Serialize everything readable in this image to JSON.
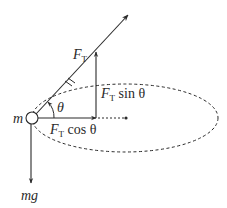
{
  "diagram": {
    "type": "force-diagram",
    "colors": {
      "stroke": "#2a2a2a",
      "background": "#ffffff"
    },
    "labels": {
      "mass": "m",
      "tension": "F",
      "tension_sub": "T",
      "vertical_component_prefix": "F",
      "vertical_component_sub": "T",
      "vertical_component_suffix": " sin θ",
      "horizontal_component_prefix": "F",
      "horizontal_component_sub": "T",
      "horizontal_component_suffix": " cos θ",
      "angle": "θ",
      "weight": "mg"
    },
    "elements": [
      {
        "name": "mass-circle",
        "center": [
          32,
          118
        ],
        "radius": 6
      },
      {
        "name": "tension-vector",
        "from": [
          32,
          118
        ],
        "to": [
          128,
          15
        ]
      },
      {
        "name": "vertical-component-arrow",
        "from": [
          96,
          118
        ],
        "to": [
          96,
          52
        ]
      },
      {
        "name": "horizontal-component-arrow",
        "from": [
          38,
          118
        ],
        "to": [
          96,
          118
        ]
      },
      {
        "name": "radius-dotted-line",
        "from": [
          96,
          118
        ],
        "to": [
          126,
          118
        ]
      },
      {
        "name": "center-dot",
        "at": [
          126,
          118
        ]
      },
      {
        "name": "circular-path-ellipse",
        "center": [
          125,
          118
        ],
        "rx": 93,
        "ry": 34,
        "style": "dashed"
      },
      {
        "name": "weight-arrow",
        "from": [
          31,
          124
        ],
        "to": [
          31,
          183
        ]
      },
      {
        "name": "angle-arc",
        "center": [
          32,
          118
        ],
        "radius": 22
      }
    ]
  }
}
